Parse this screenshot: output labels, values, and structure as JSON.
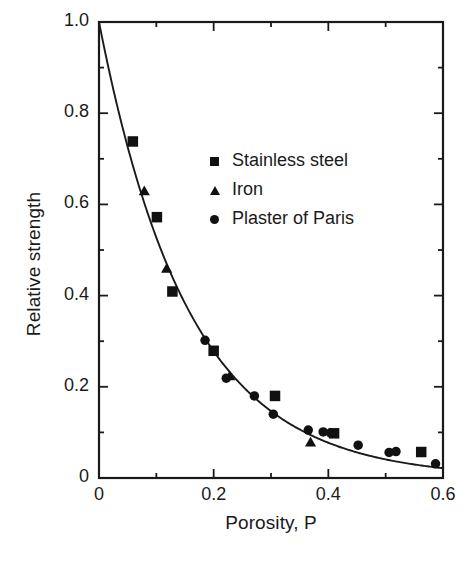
{
  "chart_data": {
    "type": "scatter",
    "title": "",
    "xlabel": "Porosity, P",
    "ylabel": "Relative strength",
    "xlim": [
      0,
      0.6
    ],
    "ylim": [
      0,
      1.0
    ],
    "xticks": [
      0,
      0.1,
      0.2,
      0.3,
      0.4,
      0.5,
      0.6
    ],
    "xticklabels": [
      "0",
      "",
      "0.2",
      "",
      "0.4",
      "",
      "0.6"
    ],
    "yticks": [
      0,
      0.1,
      0.2,
      0.3,
      0.4,
      0.5,
      0.6,
      0.7,
      0.8,
      0.9,
      1.0
    ],
    "yticklabels": [
      "0",
      "",
      "0.2",
      "",
      "0.4",
      "",
      "0.6",
      "",
      "0.8",
      "",
      "1.0"
    ],
    "grid": false,
    "legend_position": "upper center",
    "fit_curve": {
      "label": "",
      "formula": "exp(-6.4*P)",
      "decay_constant": 6.4,
      "x_start": 0.0,
      "x_end": 0.6,
      "y_start": 1.0,
      "y_end": 0.021
    },
    "series": [
      {
        "name": "Stainless steel",
        "marker": "square",
        "color": "#111111",
        "points": [
          [
            0.059,
            0.738
          ],
          [
            0.101,
            0.572
          ],
          [
            0.128,
            0.409
          ],
          [
            0.2,
            0.279
          ],
          [
            0.307,
            0.18
          ],
          [
            0.41,
            0.098
          ],
          [
            0.562,
            0.057
          ]
        ]
      },
      {
        "name": "Iron",
        "marker": "triangle",
        "color": "#111111",
        "points": [
          [
            0.079,
            0.629
          ],
          [
            0.118,
            0.459
          ],
          [
            0.228,
            0.223
          ],
          [
            0.369,
            0.078
          ]
        ]
      },
      {
        "name": "Plaster of Paris",
        "marker": "circle",
        "color": "#111111",
        "points": [
          [
            0.185,
            0.302
          ],
          [
            0.222,
            0.219
          ],
          [
            0.271,
            0.18
          ],
          [
            0.304,
            0.14
          ],
          [
            0.365,
            0.105
          ],
          [
            0.391,
            0.101
          ],
          [
            0.404,
            0.099
          ],
          [
            0.452,
            0.072
          ],
          [
            0.506,
            0.056
          ],
          [
            0.518,
            0.058
          ],
          [
            0.587,
            0.031
          ]
        ]
      }
    ]
  },
  "legend": {
    "items": [
      {
        "label": "Stainless steel",
        "marker": "square-marker"
      },
      {
        "label": "Iron",
        "marker": "triangle-marker"
      },
      {
        "label": "Plaster of Paris",
        "marker": "circle-marker"
      }
    ]
  }
}
